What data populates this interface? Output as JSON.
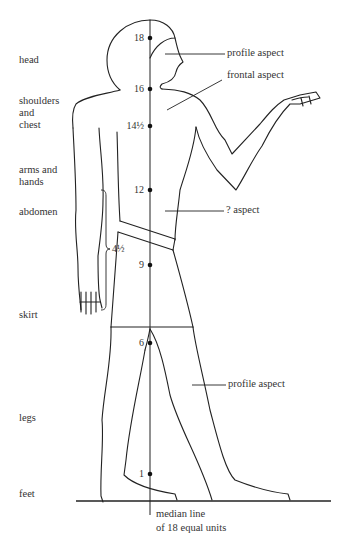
{
  "figure": {
    "body_regions": [
      {
        "label": "head"
      },
      {
        "label": "shoulders\nand\nchest"
      },
      {
        "label": "arms and\nhands"
      },
      {
        "label": "abdomen"
      },
      {
        "label": "skirt"
      },
      {
        "label": "legs"
      },
      {
        "label": "feet"
      }
    ],
    "median_marks": [
      {
        "value": "18"
      },
      {
        "value": "16"
      },
      {
        "value": "14½"
      },
      {
        "value": "12"
      },
      {
        "value": "9"
      },
      {
        "value": "6"
      },
      {
        "value": "1"
      }
    ],
    "annotations": {
      "profile_head": "profile aspect",
      "frontal": "frontal aspect",
      "unknown": "? aspect",
      "profile_legs": "profile aspect",
      "arm_span": "4½"
    },
    "caption": {
      "line1": "median line",
      "line2": "of 18 equal units"
    }
  }
}
